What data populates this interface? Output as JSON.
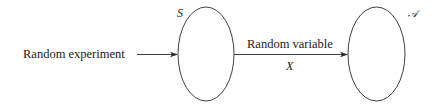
{
  "diagram": {
    "input_label": "Random experiment",
    "sample_space": {
      "label": "S",
      "shape": "ellipse"
    },
    "mapping": {
      "label": "Random variable",
      "symbol": "X"
    },
    "range_set": {
      "label": "𝒜",
      "shape": "ellipse"
    }
  },
  "colors": {
    "stroke": "#2a2a2a",
    "text": "#1a1a1a",
    "background": "#ffffff"
  }
}
